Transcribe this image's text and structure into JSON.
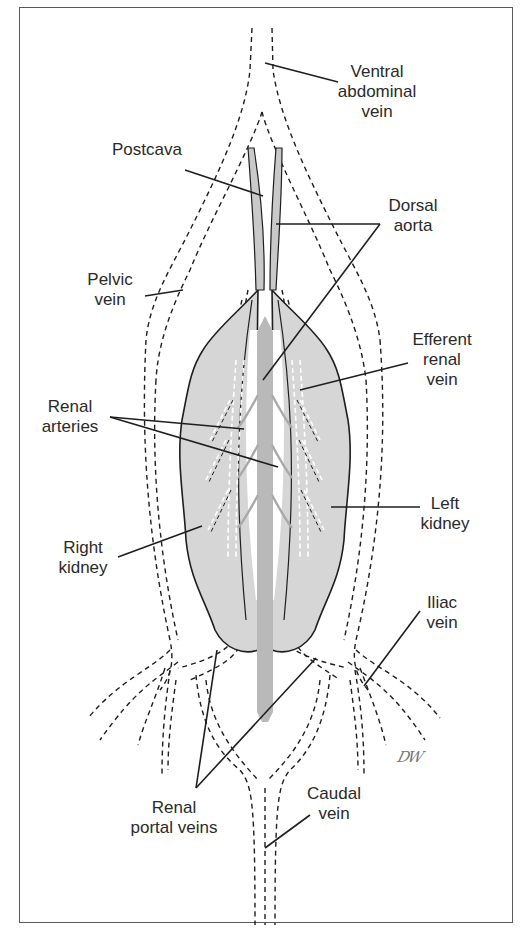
{
  "figure": {
    "colors": {
      "kidney_fill": "#d6d6d6",
      "aorta_fill": "#b9b9b9",
      "outline": "#1e1e1e",
      "text": "#2a2a2a"
    },
    "signature": "DW"
  },
  "labels": [
    {
      "id": "ventral-abdominal-vein",
      "lines": [
        "Ventral",
        "abdominal",
        "vein"
      ],
      "x": 377,
      "y": 62
    },
    {
      "id": "postcava",
      "lines": [
        "Postcava"
      ],
      "x": 147,
      "y": 140
    },
    {
      "id": "dorsal-aorta",
      "lines": [
        "Dorsal",
        "aorta"
      ],
      "x": 413,
      "y": 196
    },
    {
      "id": "pelvic-vein",
      "lines": [
        "Pelvic",
        "vein"
      ],
      "x": 110,
      "y": 270
    },
    {
      "id": "efferent-renal-vein",
      "lines": [
        "Efferent",
        "renal",
        "vein"
      ],
      "x": 442,
      "y": 330
    },
    {
      "id": "renal-arteries",
      "lines": [
        "Renal",
        "arteries"
      ],
      "x": 70,
      "y": 397
    },
    {
      "id": "left-kidney",
      "lines": [
        "Left",
        "kidney"
      ],
      "x": 445,
      "y": 494
    },
    {
      "id": "right-kidney",
      "lines": [
        "Right",
        "kidney"
      ],
      "x": 83,
      "y": 538
    },
    {
      "id": "iliac-vein",
      "lines": [
        "Iliac",
        "vein"
      ],
      "x": 442,
      "y": 593
    },
    {
      "id": "caudal-vein",
      "lines": [
        "Caudal",
        "vein"
      ],
      "x": 334,
      "y": 784
    },
    {
      "id": "renal-portal-veins",
      "lines": [
        "Renal",
        "portal veins"
      ],
      "x": 174,
      "y": 798
    }
  ],
  "leaders": [
    {
      "for": "ventral-abdominal-vein",
      "segments": [
        [
          265,
          63,
          338,
          82
        ]
      ]
    },
    {
      "for": "postcava",
      "segments": [
        [
          185,
          170,
          263,
          196
        ]
      ]
    },
    {
      "for": "dorsal-aorta",
      "segments": [
        [
          276,
          224,
          380,
          224
        ],
        [
          380,
          224,
          263,
          380
        ]
      ]
    },
    {
      "for": "pelvic-vein",
      "segments": [
        [
          145,
          296,
          183,
          290
        ]
      ]
    },
    {
      "for": "efferent-renal-vein",
      "segments": [
        [
          300,
          390,
          408,
          363
        ]
      ]
    },
    {
      "for": "renal-arteries",
      "segments": [
        [
          110,
          417,
          244,
          429
        ],
        [
          110,
          417,
          278,
          467
        ]
      ]
    },
    {
      "for": "left-kidney",
      "segments": [
        [
          331,
          507,
          420,
          507
        ]
      ]
    },
    {
      "for": "right-kidney",
      "segments": [
        [
          118,
          557,
          202,
          526
        ]
      ]
    },
    {
      "for": "iliac-vein",
      "segments": [
        [
          420,
          611,
          364,
          686
        ]
      ]
    },
    {
      "for": "caudal-vein",
      "segments": [
        [
          310,
          815,
          265,
          848
        ]
      ]
    },
    {
      "for": "renal-portal-veins",
      "segments": [
        [
          196,
          788,
          217,
          650
        ],
        [
          196,
          788,
          316,
          658
        ]
      ]
    }
  ]
}
